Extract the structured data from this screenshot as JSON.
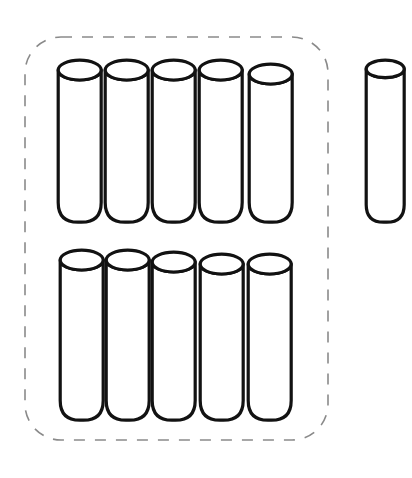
{
  "figure": {
    "kind": "math-manipulative-illustration",
    "canvas": {
      "width": 412,
      "height": 478,
      "background": "#ffffff"
    }
  },
  "group_loop": {
    "label": "dashed-grouping-loop",
    "shape": "rounded-rectangle",
    "x": 25,
    "y": 37,
    "width": 303,
    "height": 403,
    "corner_radius": 36,
    "stroke_color": "#8a8a8a",
    "stroke_width": 1.6,
    "dash_pattern": "11 10",
    "enclosed_count": 10
  },
  "rod_style": {
    "stroke_color": "#121212",
    "fill_color": "#ffffff",
    "stroke_width": 3.2,
    "top_ellipse_ry_ratio": 0.23,
    "bottom_style": "rounded"
  },
  "counts": {
    "inside_group": 10,
    "outside_group": 1,
    "total": 11,
    "top_row": 5,
    "bottom_row": 5
  },
  "rods": [
    {
      "name": "rod-top-1",
      "row": "top",
      "index": 1,
      "group": "inside",
      "x": 58,
      "y": 60,
      "width": 43,
      "height": 162
    },
    {
      "name": "rod-top-2",
      "row": "top",
      "index": 2,
      "group": "inside",
      "x": 105,
      "y": 60,
      "width": 43,
      "height": 162
    },
    {
      "name": "rod-top-3",
      "row": "top",
      "index": 3,
      "group": "inside",
      "x": 152,
      "y": 60,
      "width": 43,
      "height": 162
    },
    {
      "name": "rod-top-4",
      "row": "top",
      "index": 4,
      "group": "inside",
      "x": 199,
      "y": 60,
      "width": 43,
      "height": 162
    },
    {
      "name": "rod-top-5",
      "row": "top",
      "index": 5,
      "group": "inside",
      "x": 249,
      "y": 64,
      "width": 43,
      "height": 158
    },
    {
      "name": "rod-bottom-1",
      "row": "bottom",
      "index": 1,
      "group": "inside",
      "x": 60,
      "y": 250,
      "width": 43,
      "height": 170
    },
    {
      "name": "rod-bottom-2",
      "row": "bottom",
      "index": 2,
      "group": "inside",
      "x": 106,
      "y": 250,
      "width": 43,
      "height": 170
    },
    {
      "name": "rod-bottom-3",
      "row": "bottom",
      "index": 3,
      "group": "inside",
      "x": 152,
      "y": 252,
      "width": 43,
      "height": 168
    },
    {
      "name": "rod-bottom-4",
      "row": "bottom",
      "index": 4,
      "group": "inside",
      "x": 200,
      "y": 254,
      "width": 43,
      "height": 166
    },
    {
      "name": "rod-bottom-5",
      "row": "bottom",
      "index": 5,
      "group": "inside",
      "x": 248,
      "y": 254,
      "width": 43,
      "height": 166
    },
    {
      "name": "rod-loose-1",
      "row": "single",
      "index": 1,
      "group": "outside",
      "x": 366,
      "y": 60,
      "width": 38,
      "height": 162
    }
  ]
}
